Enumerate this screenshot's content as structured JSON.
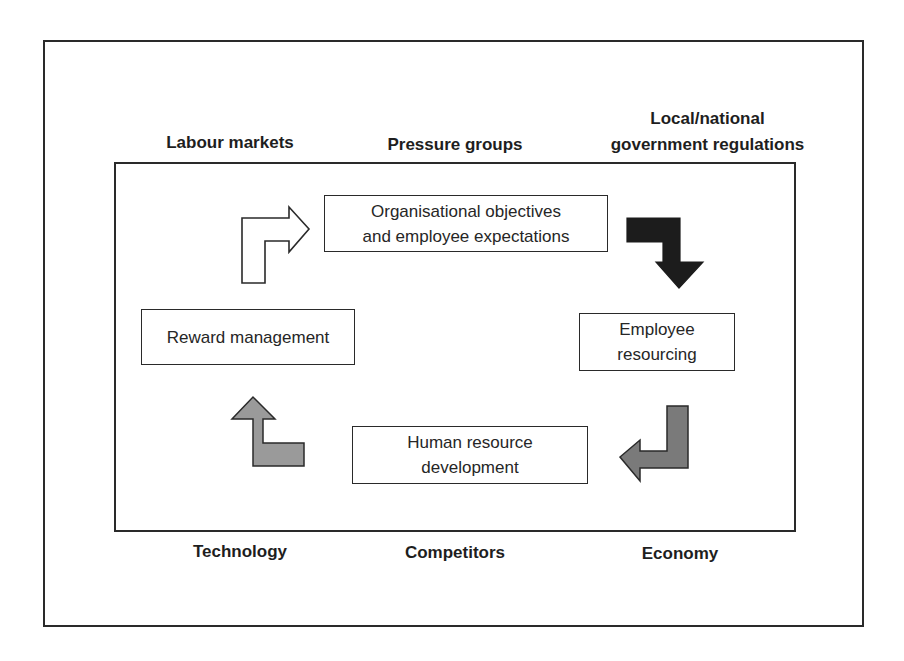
{
  "diagram": {
    "external_factors": {
      "top": [
        {
          "id": "labour",
          "label": "Labour markets"
        },
        {
          "id": "pressure",
          "label": "Pressure groups"
        },
        {
          "id": "local",
          "label_line1": "Local/national",
          "label_line2": "government regulations"
        }
      ],
      "bottom": [
        {
          "id": "technology",
          "label": "Technology"
        },
        {
          "id": "competitors",
          "label": "Competitors"
        },
        {
          "id": "economy",
          "label": "Economy"
        }
      ]
    },
    "cycle": [
      {
        "id": "org",
        "line1": "Organisational objectives",
        "line2": "and employee expectations"
      },
      {
        "id": "resourcing",
        "line1": "Employee",
        "line2": "resourcing"
      },
      {
        "id": "hrd",
        "line1": "Human resource",
        "line2": "development"
      },
      {
        "id": "reward",
        "line1": "Reward management"
      }
    ],
    "arrows": [
      {
        "id": "reward-to-org",
        "direction": "right",
        "fill": "#ffffff",
        "stroke": "#2a2a2a"
      },
      {
        "id": "org-to-resourcing",
        "direction": "down",
        "fill": "#1c1c1c",
        "stroke": "#1c1c1c"
      },
      {
        "id": "resourcing-to-hrd",
        "direction": "left",
        "fill": "#7a7a7a",
        "stroke": "#2a2a2a"
      },
      {
        "id": "hrd-to-reward",
        "direction": "up",
        "fill": "#9a9a9a",
        "stroke": "#2a2a2a"
      }
    ]
  }
}
